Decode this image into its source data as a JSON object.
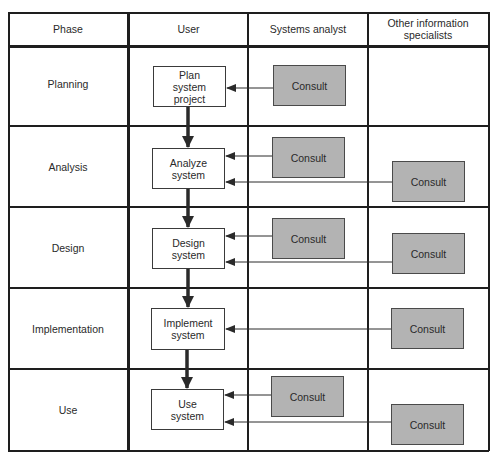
{
  "diagram": {
    "colors": {
      "consult_fill": "#b3b3b3",
      "task_fill": "#ffffff",
      "line": "#1e1e1e"
    },
    "headers": {
      "phase": "Phase",
      "user": "User",
      "systems_analyst": "Systems analyst",
      "other_specialists": "Other information specialists"
    },
    "rows": [
      {
        "phase": "Planning",
        "user_task": "Plan\nsystem\nproject",
        "analyst": "Consult",
        "other": null
      },
      {
        "phase": "Analysis",
        "user_task": "Analyze\nsystem",
        "analyst": "Consult",
        "other": "Consult"
      },
      {
        "phase": "Design",
        "user_task": "Design\nsystem",
        "analyst": "Consult",
        "other": "Consult"
      },
      {
        "phase": "Implementation",
        "user_task": "Implement\nsystem",
        "analyst": null,
        "other": "Consult"
      },
      {
        "phase": "Use",
        "user_task": "Use\nsystem",
        "analyst": "Consult",
        "other": "Consult"
      }
    ],
    "flow": [
      {
        "from": "Plan system project",
        "to": "Analyze system"
      },
      {
        "from": "Analyze system",
        "to": "Design system"
      },
      {
        "from": "Design system",
        "to": "Implement system"
      },
      {
        "from": "Implement system",
        "to": "Use system"
      }
    ],
    "consult_arrows": [
      {
        "from": "Systems analyst Consult (Planning)",
        "to": "Plan system project"
      },
      {
        "from": "Systems analyst Consult (Analysis)",
        "to": "Analyze system"
      },
      {
        "from": "Other specialists Consult (Analysis)",
        "to": "Analyze system"
      },
      {
        "from": "Systems analyst Consult (Design)",
        "to": "Design system"
      },
      {
        "from": "Other specialists Consult (Design)",
        "to": "Design system"
      },
      {
        "from": "Other specialists Consult (Implementation)",
        "to": "Implement system"
      },
      {
        "from": "Systems analyst Consult (Use)",
        "to": "Use system"
      },
      {
        "from": "Other specialists Consult (Use)",
        "to": "Use system"
      }
    ]
  }
}
